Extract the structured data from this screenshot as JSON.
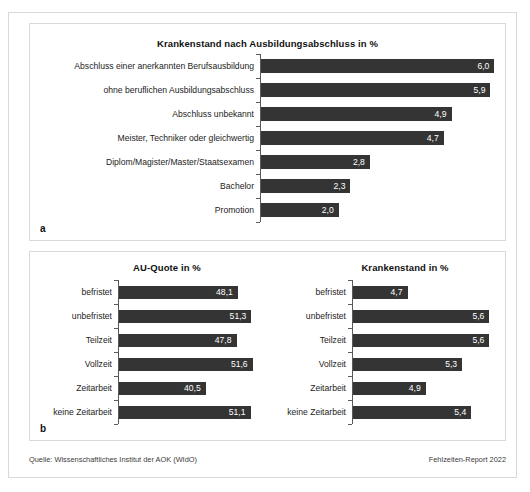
{
  "figure": {
    "panel_a_letter": "a",
    "panel_b_letter": "b"
  },
  "footer": {
    "source": "Quelle: Wissenschaftliches Institut der AOK (WIdO)",
    "report": "Fehlzeiten-Report 2022"
  },
  "colors": {
    "bar": "#343434",
    "axis": "#5a5a5a",
    "frame": "#d8d8d8",
    "value_text": "#ffffff",
    "label_text": "#1c1c1c"
  },
  "chart_data": [
    {
      "id": "panel-a",
      "type": "bar",
      "orientation": "horizontal",
      "title": "Krankenstand nach Ausbildungsabschluss in %",
      "xlabel": "",
      "ylabel": "",
      "grid": false,
      "legend": "none",
      "xlim": [
        0,
        6.3
      ],
      "categories": [
        "Abschluss einer anerkannten Berufsausbildung",
        "ohne beruflichen Ausbildungsabschluss",
        "Abschluss unbekannt",
        "Meister, Techniker oder gleichwertig",
        "Diplom/Magister/Master/Staatsexamen",
        "Bachelor",
        "Promotion"
      ],
      "values": [
        6.0,
        5.9,
        4.9,
        4.7,
        2.8,
        2.3,
        2.0
      ],
      "value_labels": [
        "6,0",
        "5,9",
        "4,9",
        "4,7",
        "2,8",
        "2,3",
        "2,0"
      ]
    },
    {
      "id": "panel-b-left",
      "type": "bar",
      "orientation": "horizontal",
      "title": "AU-Quote in %",
      "xlabel": "",
      "ylabel": "",
      "grid": false,
      "legend": "none",
      "xlim": [
        20.0,
        55.0
      ],
      "categories": [
        "befristet",
        "unbefristet",
        "Teilzeit",
        "Vollzeit",
        "Zeitarbeit",
        "keine Zeitarbeit"
      ],
      "values": [
        48.1,
        51.3,
        47.8,
        51.6,
        40.5,
        51.1
      ],
      "value_labels": [
        "48,1",
        "51,3",
        "47,8",
        "51,6",
        "40,5",
        "51,1"
      ]
    },
    {
      "id": "panel-b-right",
      "type": "bar",
      "orientation": "horizontal",
      "title": "Krankenstand in %",
      "xlabel": "",
      "ylabel": "",
      "grid": false,
      "legend": "none",
      "xlim": [
        4.1,
        5.75
      ],
      "categories": [
        "befristet",
        "unbefristet",
        "Teilzeit",
        "Vollzeit",
        "Zeitarbeit",
        "keine Zeitarbeit"
      ],
      "values": [
        4.7,
        5.6,
        5.6,
        5.3,
        4.9,
        5.4
      ],
      "value_labels": [
        "4,7",
        "5,6",
        "5,6",
        "5,3",
        "4,9",
        "5,4"
      ]
    }
  ]
}
